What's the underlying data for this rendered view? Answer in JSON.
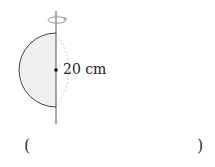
{
  "figure": {
    "shape": "semicircle",
    "rotation_axis": "vertical",
    "rotation_icon": "rotation-arrow-icon",
    "diameter_label": "20 cm",
    "colors": {
      "outline": "#444444",
      "fill": "#f0f0f0",
      "axis": "#555555",
      "ghost_arc": "#c8c8c8",
      "rotation_arrow": "#9a9a9a"
    }
  },
  "answer": {
    "open_paren": "(",
    "close_paren": ")",
    "value": ""
  }
}
